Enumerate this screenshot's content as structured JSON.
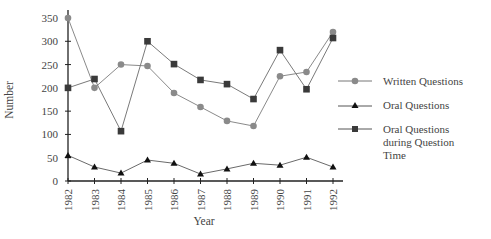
{
  "chart_data": {
    "type": "line",
    "title": "",
    "xlabel": "Year",
    "ylabel": "Number",
    "ylim": [
      0,
      350
    ],
    "yticks": [
      0,
      50,
      100,
      150,
      200,
      250,
      300,
      350
    ],
    "grid": false,
    "legend_position": "right",
    "categories": [
      "1982",
      "1983",
      "1984",
      "1985",
      "1986",
      "1987",
      "1988",
      "1989",
      "1990",
      "1991",
      "1992"
    ],
    "series": [
      {
        "name": "Written Questions",
        "marker": "circle",
        "color": "#8a8a8a",
        "values": [
          350,
          200,
          250,
          247,
          189,
          159,
          129,
          118,
          225,
          234,
          320
        ]
      },
      {
        "name": "Oral Questions",
        "marker": "triangle",
        "color": "#111111",
        "values": [
          55,
          30,
          17,
          45,
          38,
          15,
          26,
          38,
          34,
          51,
          30
        ]
      },
      {
        "name": "Oral Questions during Question Time",
        "marker": "square",
        "color": "#3a3a3a",
        "values": [
          200,
          219,
          107,
          300,
          251,
          217,
          208,
          176,
          281,
          197,
          307
        ]
      }
    ]
  },
  "legend": {
    "items": [
      {
        "label_lines": [
          "Written Questions"
        ]
      },
      {
        "label_lines": [
          "Oral Questions"
        ]
      },
      {
        "label_lines": [
          "Oral Questions",
          "during Question",
          "Time"
        ]
      }
    ]
  }
}
